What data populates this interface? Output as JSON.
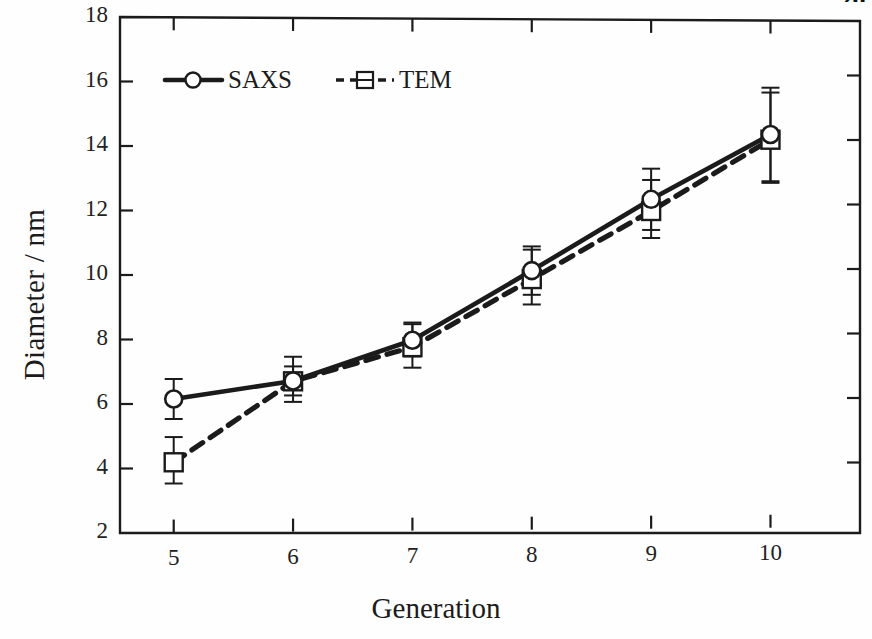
{
  "chart_data": {
    "type": "line",
    "title": "",
    "xlabel": "Generation",
    "ylabel": "Diameter / nm",
    "x": [
      5,
      6,
      7,
      8,
      9,
      10
    ],
    "xtick_labels": [
      "5",
      "6",
      "7",
      "8",
      "9",
      "10"
    ],
    "ytick_labels": [
      "2",
      "4",
      "6",
      "8",
      "10",
      "12",
      "14",
      "16",
      "18"
    ],
    "ytick_values": [
      2,
      4,
      6,
      8,
      10,
      12,
      14,
      16,
      18
    ],
    "xlim": [
      4.55,
      10.75
    ],
    "ylim": [
      2,
      18
    ],
    "grid": false,
    "legend_position": "upper-left-inside",
    "series": [
      {
        "name": "SAXS",
        "marker": "open-circle",
        "linestyle": "solid",
        "color": "#141414",
        "values": [
          6.15,
          6.7,
          7.95,
          10.1,
          12.3,
          14.3
        ],
        "errors": [
          0.62,
          0.45,
          0.5,
          0.75,
          0.95,
          1.45
        ]
      },
      {
        "name": "TEM",
        "marker": "open-square",
        "linestyle": "dashed",
        "color": "#141414",
        "values": [
          4.25,
          6.75,
          7.8,
          9.9,
          12.0,
          14.2
        ],
        "errors": [
          0.72,
          0.7,
          0.7,
          0.85,
          0.9,
          1.4
        ]
      }
    ]
  },
  "legend": {
    "entries": [
      {
        "label": "SAXS"
      },
      {
        "label": "TEM"
      }
    ]
  },
  "corner": {
    "clipped_text": "20"
  }
}
